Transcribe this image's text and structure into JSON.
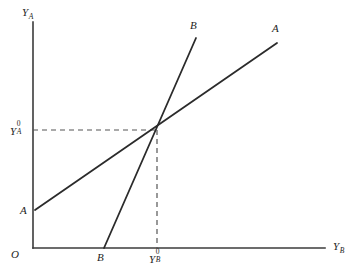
{
  "figure": {
    "background_color": "#ffffff",
    "axis_color": "#3b3b3b",
    "curve_color": "#2b2b2b",
    "guide_color": "#555555",
    "origin_label": "O",
    "y_axis_label": {
      "base": "Y",
      "sub": "A"
    },
    "x_axis_label": {
      "base": "Y",
      "sub": "B"
    },
    "equilibrium_y_label": {
      "base": "Y",
      "sup": "0",
      "sub": "A"
    },
    "equilibrium_x_label": {
      "base": "Y",
      "sup": "0",
      "sub": "B"
    },
    "curve_a_start_label": "A",
    "curve_a_end_label": "A",
    "curve_b_start_label": "B",
    "curve_b_end_label": "B"
  },
  "chart_data": {
    "type": "line",
    "title": "",
    "xlabel": "Y_B",
    "ylabel": "Y_A",
    "grid": false,
    "legend": "none",
    "axes": {
      "origin_px": {
        "x": 33,
        "y": 248
      },
      "y_axis_top_px": {
        "x": 33,
        "y": 22
      },
      "x_axis_right_px": {
        "x": 325,
        "y": 248
      }
    },
    "series": [
      {
        "name": "A",
        "label": "A",
        "description": "Country A reaction / income line, flatter upward slope",
        "points_px": [
          {
            "x": 35,
            "y": 210
          },
          {
            "x": 277,
            "y": 43
          }
        ],
        "style": "solid"
      },
      {
        "name": "B",
        "label": "B",
        "description": "Country B reaction / income line, steeper upward slope",
        "points_px": [
          {
            "x": 104,
            "y": 248
          },
          {
            "x": 196,
            "y": 38
          }
        ],
        "style": "solid"
      }
    ],
    "annotations": [
      {
        "name": "equilibrium-point",
        "point_px": {
          "x": 157,
          "y": 130
        },
        "x_label": "Y_B^0",
        "y_label": "Y_A^0"
      },
      {
        "name": "horizontal-guide",
        "from_px": {
          "x": 33,
          "y": 130
        },
        "to_px": {
          "x": 157,
          "y": 130
        },
        "style": "dashed"
      },
      {
        "name": "vertical-guide",
        "from_px": {
          "x": 157,
          "y": 130
        },
        "to_px": {
          "x": 157,
          "y": 248
        },
        "style": "dashed"
      }
    ]
  }
}
